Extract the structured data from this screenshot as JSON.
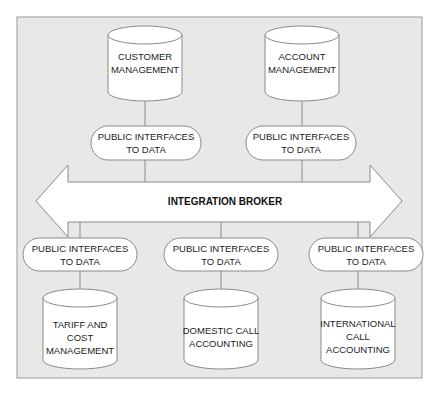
{
  "diagram": {
    "title": "",
    "broker": {
      "label": "INTEGRATION BROKER"
    },
    "top_systems": [
      {
        "id": "customer",
        "lines": [
          "CUSTOMER",
          "MANAGEMENT"
        ],
        "interface": [
          "PUBLIC INTERFACES",
          "TO DATA"
        ]
      },
      {
        "id": "account",
        "lines": [
          "ACCOUNT",
          "MANAGEMENT"
        ],
        "interface": [
          "PUBLIC INTERFACES",
          "TO DATA"
        ]
      }
    ],
    "bottom_systems": [
      {
        "id": "tariff",
        "lines": [
          "TARIFF AND",
          "COST",
          "MANAGEMENT"
        ],
        "interface": [
          "PUBLIC INTERFACES",
          "TO DATA"
        ]
      },
      {
        "id": "domestic",
        "lines": [
          "DOMESTIC CALL",
          "ACCOUNTING"
        ],
        "interface": [
          "PUBLIC INTERFACES",
          "TO DATA"
        ]
      },
      {
        "id": "international",
        "lines": [
          "INTERNATIONAL",
          "CALL",
          "ACCOUNTING"
        ],
        "interface": [
          "PUBLIC INTERFACES",
          "TO DATA"
        ]
      }
    ],
    "colors": {
      "panel": "#e8e8e6",
      "stroke": "#8a8a8a",
      "fill": "#ffffff",
      "text": "#222222"
    }
  }
}
